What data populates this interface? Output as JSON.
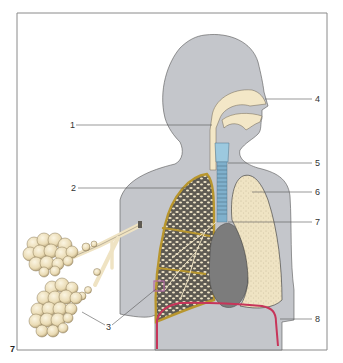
{
  "figure": {
    "number": "7",
    "colors": {
      "frame": "#8a8a8a",
      "body": "#c4c6cb",
      "body_outline": "#555555",
      "airway_cream": "#f3e7c7",
      "larynx_blue": "#9cc9df",
      "trachea_blue": "#7fb0cc",
      "lung_border": "#b8962e",
      "lung_section_bg": "#5e5a52",
      "lung_cells": "#f1e6c8",
      "lung_surface": "#efe3c3",
      "heart": "#7c7c7c",
      "diaphragm": "#c7355a",
      "focus_box": "#b36aa6",
      "label_line": "#555555"
    }
  },
  "labels": [
    {
      "id": "1",
      "text": "1"
    },
    {
      "id": "2",
      "text": "2"
    },
    {
      "id": "3",
      "text": "3"
    },
    {
      "id": "4",
      "text": "4"
    },
    {
      "id": "5",
      "text": "5"
    },
    {
      "id": "6",
      "text": "6"
    },
    {
      "id": "7",
      "text": "7"
    },
    {
      "id": "8",
      "text": "8"
    }
  ]
}
